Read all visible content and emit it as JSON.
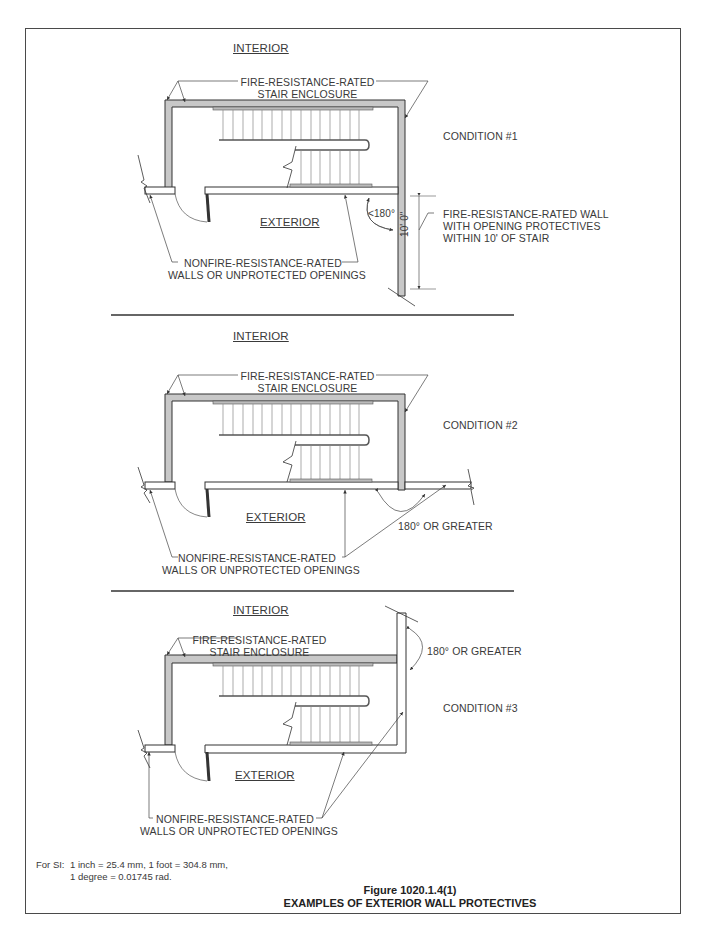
{
  "figure": {
    "number": "Figure 1020.1.4(1)",
    "title": "EXAMPLES OF EXTERIOR WALL PROTECTIVES"
  },
  "notes": {
    "prefix": "For SI:",
    "line1": "1 inch = 25.4 mm, 1 foot = 304.8 mm,",
    "line2": "1 degree = 0.01745 rad."
  },
  "conditions": [
    {
      "name": "CONDITION #1",
      "interior_label": "INTERIOR",
      "exterior_label": "EXTERIOR",
      "enclosure_label_1": "FIRE-RESISTANCE-RATED",
      "enclosure_label_2": "STAIR ENCLOSURE",
      "nonrated_label_1": "NONFIRE-RESISTANCE-RATED",
      "nonrated_label_2": "WALLS OR UNPROTECTED OPENINGS",
      "angle_label": "<180°",
      "dimension_label": "10' 0\"",
      "rated_wall_label_1": "FIRE-RESISTANCE-RATED WALL",
      "rated_wall_label_2": "WITH OPENING PROTECTIVES",
      "rated_wall_label_3": "WITHIN 10' OF STAIR"
    },
    {
      "name": "CONDITION #2",
      "interior_label": "INTERIOR",
      "exterior_label": "EXTERIOR",
      "enclosure_label_1": "FIRE-RESISTANCE-RATED",
      "enclosure_label_2": "STAIR ENCLOSURE",
      "nonrated_label_1": "NONFIRE-RESISTANCE-RATED",
      "nonrated_label_2": "WALLS OR UNPROTECTED OPENINGS",
      "angle_label": "180° OR GREATER"
    },
    {
      "name": "CONDITION #3",
      "interior_label": "INTERIOR",
      "exterior_label": "EXTERIOR",
      "enclosure_label_1": "FIRE-RESISTANCE-RATED",
      "enclosure_label_2": "STAIR ENCLOSURE",
      "nonrated_label_1": "NONFIRE-RESISTANCE-RATED",
      "nonrated_label_2": "WALLS OR UNPROTECTED OPENINGS",
      "angle_label": "180° OR GREATER"
    }
  ],
  "colors": {
    "rated_wall_fill": "#c8c8c8",
    "line": "#3a3a3a",
    "frame": "#4a4a4a"
  }
}
